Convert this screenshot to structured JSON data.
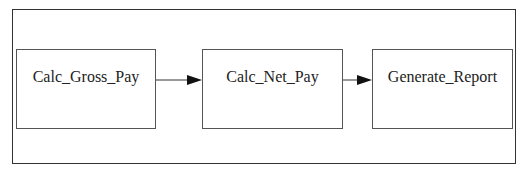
{
  "diagram": {
    "nodes": [
      {
        "id": "calc_gross_pay",
        "label": "Calc_Gross_Pay"
      },
      {
        "id": "calc_net_pay",
        "label": "Calc_Net_Pay"
      },
      {
        "id": "generate_report",
        "label": "Generate_Report"
      }
    ],
    "edges": [
      {
        "from": "calc_gross_pay",
        "to": "calc_net_pay"
      },
      {
        "from": "calc_net_pay",
        "to": "generate_report"
      }
    ]
  }
}
